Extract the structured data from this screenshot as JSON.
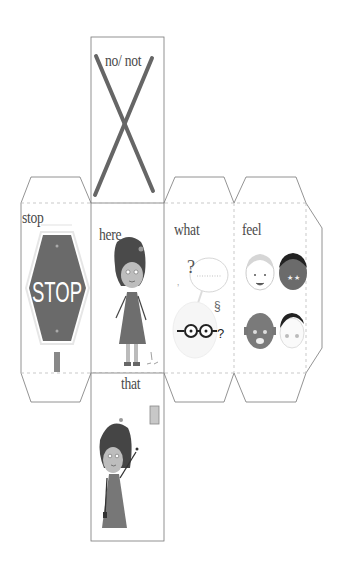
{
  "net": {
    "faces": [
      {
        "id": "top",
        "word": "no/ not",
        "icon": "x-cross-icon"
      },
      {
        "id": "left",
        "word": "stop",
        "icon": "stop-sign-icon",
        "sign_text": "STOP"
      },
      {
        "id": "front",
        "word": "here",
        "icon": "girl-standing-icon"
      },
      {
        "id": "right",
        "word": "what",
        "icon": "thinking-face-icon"
      },
      {
        "id": "back",
        "word": "feel",
        "icon": "emotion-faces-icon"
      },
      {
        "id": "bottom",
        "word": "that",
        "icon": "girl-pointing-icon"
      }
    ]
  },
  "colors": {
    "outline": "#666666",
    "dashed": "#bbbbbb",
    "dark_gray": "#5a5a5a",
    "mid_gray": "#7a7a7a",
    "light_gray": "#d8d8d8",
    "text": "#4a4a4a"
  }
}
